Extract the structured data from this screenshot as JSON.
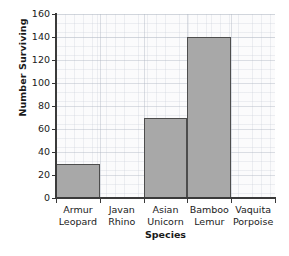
{
  "chart_data": {
    "type": "bar",
    "title": "",
    "subtitle": "",
    "xlabel": "Species",
    "ylabel": "Number Surviving",
    "categories": [
      "Armur Leopard",
      "Javan Rhino",
      "Asian Unicorn",
      "Bamboo Lemur",
      "Vaquita Porpoise"
    ],
    "category_lines": [
      [
        "Armur",
        "Leopard"
      ],
      [
        "Javan",
        "Rhino"
      ],
      [
        "Asian",
        "Unicorn"
      ],
      [
        "Bamboo",
        "Lemur"
      ],
      [
        "Vaquita",
        "Porpoise"
      ]
    ],
    "values": [
      30,
      0,
      70,
      140,
      0
    ],
    "ylim": [
      0,
      160
    ],
    "ytick_step": 20,
    "yticks": [
      0,
      20,
      40,
      60,
      80,
      100,
      120,
      140,
      160
    ],
    "ytick_labels": [
      "0",
      "20",
      "40",
      "60",
      "80",
      "100",
      "120",
      "140",
      "160"
    ],
    "grid": true,
    "legend": false,
    "legend_position": "none",
    "bar_fill_color": "#a8a8a8",
    "bar_edge_color": "#4d4d4d",
    "axis_color": "#3a3a3a",
    "grid_color": "#aab2be",
    "plot_background_color": "#fbfbfc"
  }
}
